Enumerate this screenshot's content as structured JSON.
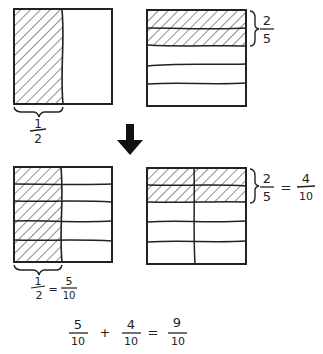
{
  "diagram": {
    "stroke_color": "#222222",
    "background": "#ffffff",
    "top_left": {
      "fraction": {
        "num": "1",
        "den": "2"
      },
      "description": "Square with left half shaded"
    },
    "top_right": {
      "fraction": {
        "num": "2",
        "den": "5"
      },
      "description": "Square in 5 horizontal strips, top 2 shaded"
    },
    "arrow": {
      "direction": "down",
      "icon": "down-arrow-icon"
    },
    "bottom_left": {
      "label": {
        "lhs_num": "1",
        "lhs_den": "2",
        "eq": "=",
        "rhs_num": "5",
        "rhs_den": "10"
      },
      "description": "Square in 2 columns x 5 rows, left column shaded"
    },
    "bottom_right": {
      "label": {
        "lhs_num": "2",
        "lhs_den": "5",
        "eq": "=",
        "rhs_num": "4",
        "rhs_den": "10"
      },
      "description": "Square in 2 columns x 5 rows, top 2 rows shaded"
    },
    "equation": {
      "a_num": "5",
      "a_den": "10",
      "op": "+",
      "b_num": "4",
      "b_den": "10",
      "eq": "=",
      "c_num": "9",
      "c_den": "10"
    }
  }
}
